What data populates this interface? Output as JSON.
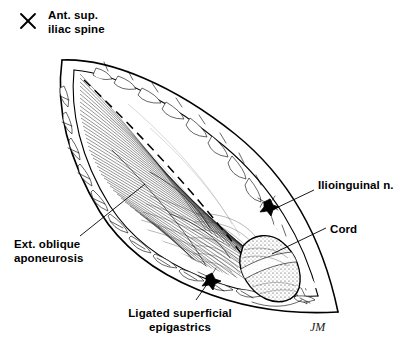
{
  "figure": {
    "type": "line-drawing",
    "signature": "JM",
    "background_color": "#ffffff",
    "ink_color": "#000000"
  },
  "markers": {
    "asis_marker_glyph": "X",
    "asis_marker_name": "anterior-superior-iliac-spine-marker"
  },
  "labels": [
    {
      "id": "ant-sup-iliac-spine",
      "line1": "Ant. sup.",
      "line2": "iliac spine",
      "x": 48,
      "y": 18,
      "align": "start"
    },
    {
      "id": "ext-oblique-aponeurosis",
      "line1": "Ext. oblique",
      "line2": "aponeurosis",
      "x": 14,
      "y": 243,
      "align": "start"
    },
    {
      "id": "ligated-superficial-epigastrics",
      "line1": "Ligated superficial",
      "line2": "epigastrics",
      "x": 180,
      "y": 312,
      "align": "middle"
    },
    {
      "id": "ilioinguinal-nerve",
      "line1": "Ilioinguinal n.",
      "line2": "",
      "x": 318,
      "y": 185,
      "align": "start"
    },
    {
      "id": "cord",
      "line1": "Cord",
      "line2": "",
      "x": 330,
      "y": 229,
      "align": "start"
    }
  ],
  "anatomy": {
    "structures": [
      "skin and subcutaneous fat wound edges",
      "external oblique aponeurosis",
      "spermatic cord",
      "ilioinguinal nerve",
      "ligated superficial epigastric vessels",
      "dashed planned incision line"
    ],
    "ligature_count": 2
  }
}
